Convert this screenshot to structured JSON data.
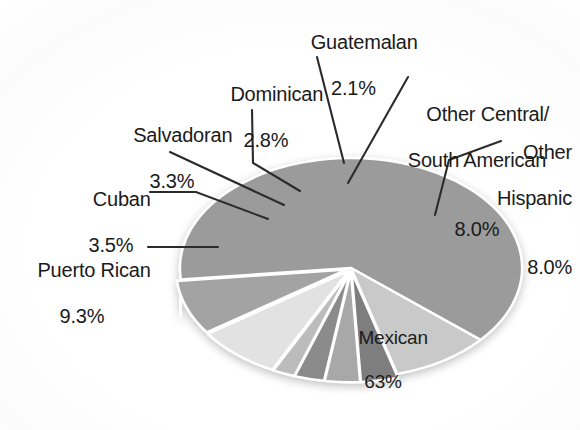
{
  "chart_data": {
    "type": "pie",
    "title": "",
    "subtitle": "",
    "xlabel": "",
    "ylabel": "",
    "legend_position": "none",
    "grid": false,
    "style": "3d-exploded-grayscale",
    "units": "percent",
    "categories": [
      "Mexican",
      "Puerto Rican",
      "Cuban",
      "Salvadoran",
      "Dominican",
      "Guatemalan",
      "Other Central/South American",
      "Other Hispanic"
    ],
    "values": [
      63,
      9.3,
      3.5,
      3.3,
      2.8,
      2.1,
      8.0,
      8.0
    ],
    "value_labels": [
      "63%",
      "9.3%",
      "3.5%",
      "3.3%",
      "2.8%",
      "2.1%",
      "8.0%",
      "8.0%"
    ],
    "slices": [
      {
        "label": "Mexican",
        "value": 63,
        "value_label": "63%",
        "color": "#9b9b9b",
        "label_placement": "inside"
      },
      {
        "label": "Puerto Rican",
        "value": 9.3,
        "value_label": "9.3%",
        "color": "#c9c9c9",
        "label_placement": "callout-left"
      },
      {
        "label": "Cuban",
        "value": 3.5,
        "value_label": "3.5%",
        "color": "#7e7e7e",
        "label_placement": "callout-left"
      },
      {
        "label": "Salvadoran",
        "value": 3.3,
        "value_label": "3.3%",
        "color": "#a8a8a8",
        "label_placement": "callout-left"
      },
      {
        "label": "Dominican",
        "value": 2.8,
        "value_label": "2.8%",
        "color": "#8b8b8b",
        "label_placement": "callout-top"
      },
      {
        "label": "Guatemalan",
        "value": 2.1,
        "value_label": "2.1%",
        "color": "#bcbcbc",
        "label_placement": "callout-top"
      },
      {
        "label": "Other Central/South American",
        "value": 8.0,
        "value_label": "8.0%",
        "color": "#e2e2e2",
        "label_placement": "callout-top-right"
      },
      {
        "label": "Other Hispanic",
        "value": 8.0,
        "value_label": "8.0%",
        "color": "#a3a3a3",
        "label_placement": "callout-right"
      }
    ],
    "colors": {
      "background": "#ffffff",
      "separator": "#ffffff",
      "text": "#1a1a1a",
      "leader_line": "#2b2b2b"
    }
  },
  "labels": {
    "mexican": {
      "name": "Mexican",
      "pct": "63%"
    },
    "puerto_rican": {
      "name": "Puerto Rican",
      "pct": "9.3%"
    },
    "cuban": {
      "name": "Cuban",
      "pct": "3.5%"
    },
    "salvadoran": {
      "name": "Salvadoran",
      "pct": "3.3%"
    },
    "dominican": {
      "name": "Dominican",
      "pct": "2.8%"
    },
    "guatemalan": {
      "name": "Guatemalan",
      "pct": "2.1%"
    },
    "other_cs": {
      "line1": "Other Central/",
      "line2": "South American",
      "pct": "8.0%"
    },
    "other_hispanic": {
      "line1": "Other",
      "line2": "Hispanic",
      "pct": "8.0%"
    }
  }
}
